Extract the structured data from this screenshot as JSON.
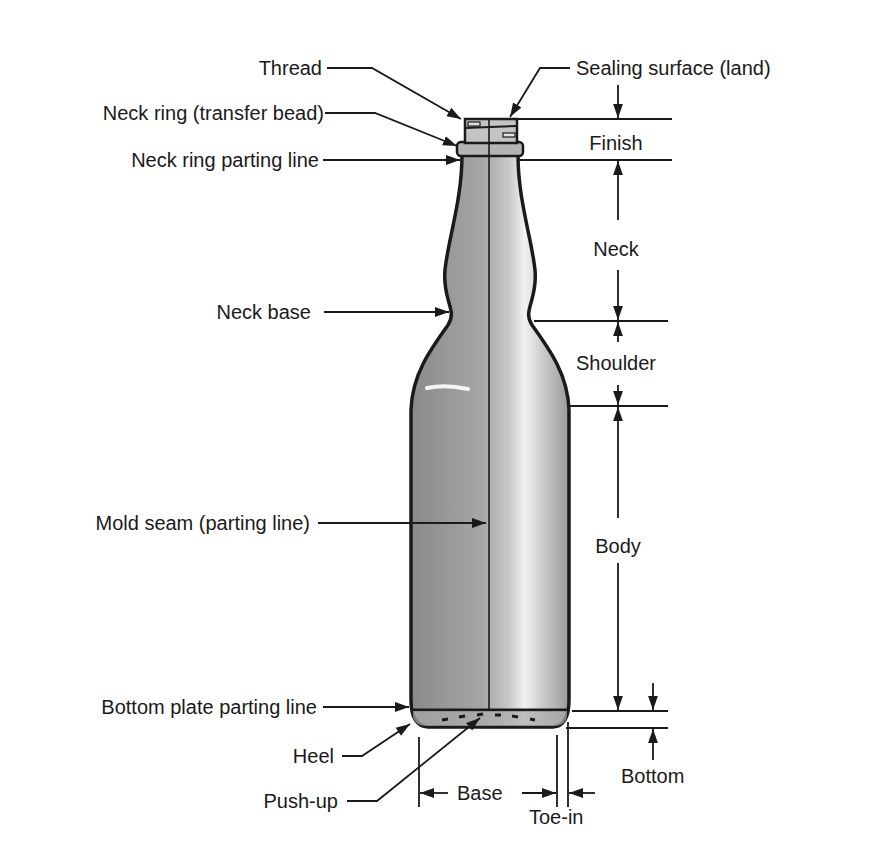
{
  "diagram": {
    "colors": {
      "line": "#1a1a1a",
      "glass_dark": "#8e8e8e",
      "glass_light": "#d6d6d6",
      "highlight": "#f4f4f4",
      "text": "#1a1a1a",
      "background": "#ffffff"
    },
    "left_callouts": [
      {
        "id": "thread",
        "label": "Thread"
      },
      {
        "id": "neck_ring",
        "label": "Neck ring (transfer bead)"
      },
      {
        "id": "neck_ring_parting_line",
        "label": "Neck ring parting line"
      },
      {
        "id": "neck_base",
        "label": "Neck base"
      },
      {
        "id": "mold_seam",
        "label": "Mold seam (parting line)"
      },
      {
        "id": "bottom_plate_parting_line",
        "label": "Bottom plate parting line"
      },
      {
        "id": "heel",
        "label": "Heel"
      },
      {
        "id": "push_up",
        "label": "Push-up"
      }
    ],
    "top_callout": {
      "id": "sealing_surface",
      "label": "Sealing surface (land)"
    },
    "dimensions_right": [
      {
        "id": "finish",
        "label": "Finish"
      },
      {
        "id": "neck",
        "label": "Neck"
      },
      {
        "id": "shoulder",
        "label": "Shoulder"
      },
      {
        "id": "body",
        "label": "Body"
      },
      {
        "id": "bottom",
        "label": "Bottom"
      }
    ],
    "dimensions_bottom": [
      {
        "id": "base",
        "label": "Base"
      },
      {
        "id": "toe_in",
        "label": "Toe-in"
      }
    ]
  }
}
